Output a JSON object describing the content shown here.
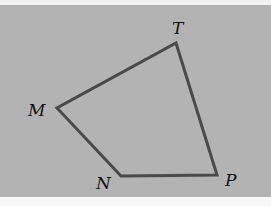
{
  "figure": {
    "type": "quadrilateral",
    "name": "MTPN",
    "background_color": "#b3b3b3",
    "stroke_color": "#4a4a4a",
    "vertices": [
      {
        "label": "T",
        "x": 176,
        "y": 43,
        "label_x": 172,
        "label_y": 34
      },
      {
        "label": "P",
        "x": 217,
        "y": 175,
        "label_x": 225,
        "label_y": 186
      },
      {
        "label": "N",
        "x": 121,
        "y": 176,
        "label_x": 96,
        "label_y": 189
      },
      {
        "label": "M",
        "x": 57,
        "y": 108,
        "label_x": 28,
        "label_y": 116
      }
    ],
    "sides": [
      "MT",
      "TP",
      "PN",
      "NM"
    ]
  }
}
